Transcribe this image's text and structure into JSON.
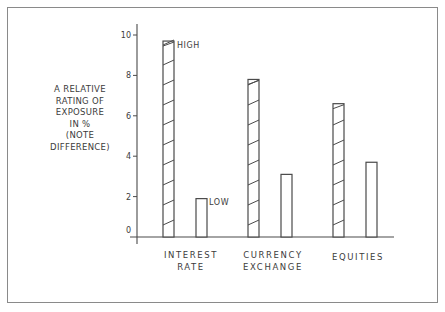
{
  "chart_data": {
    "type": "bar",
    "title": "",
    "ylabel_lines": [
      "A RELATIVE",
      "RATING OF",
      "EXPOSURE",
      "IN %",
      "(NOTE",
      "DIFFERENCE)"
    ],
    "xlabel": "",
    "categories": [
      {
        "lines": [
          "INTEREST",
          "RATE"
        ]
      },
      {
        "lines": [
          "CURRENCY",
          "EXCHANGE"
        ]
      },
      {
        "lines": [
          "EQUITIES"
        ]
      }
    ],
    "series": [
      {
        "name": "HIGH",
        "style": "hatched",
        "values": [
          9.7,
          7.8,
          6.6
        ]
      },
      {
        "name": "LOW",
        "style": "plain",
        "values": [
          1.9,
          3.1,
          3.7
        ]
      }
    ],
    "annotations": [
      {
        "text": "HIGH",
        "target": "INTEREST RATE high bar"
      },
      {
        "text": "LOW",
        "target": "INTEREST RATE low bar"
      }
    ],
    "yticks": [
      0,
      2,
      4,
      6,
      8,
      10
    ],
    "ylim": [
      0,
      10
    ],
    "grid": false,
    "legend": "none (inline annotations HIGH / LOW)"
  },
  "colors": {
    "line": "#4a4a4a",
    "frame": "#8a8a8a",
    "text": "#3c3c3c"
  }
}
